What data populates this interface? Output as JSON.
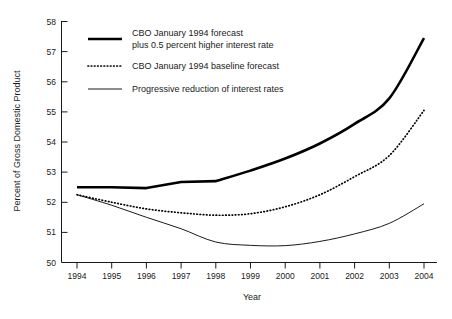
{
  "chart_data": {
    "type": "line",
    "title": "",
    "xlabel": "Year",
    "ylabel": "Percent of Gross Domestic Product",
    "xlim": [
      1994,
      2004
    ],
    "ylim": [
      50,
      58
    ],
    "ytick_labels": [
      "58",
      "57",
      "56",
      "55",
      "54",
      "53",
      "52",
      "51",
      "50"
    ],
    "yticks": [
      58,
      57,
      56,
      55,
      54,
      53,
      52,
      51,
      50
    ],
    "xtick_labels": [
      "1994",
      "1995",
      "1996",
      "1997",
      "1998",
      "1999",
      "2000",
      "2001",
      "2002",
      "2003",
      "2004"
    ],
    "x": [
      1994,
      1995,
      1996,
      1997,
      1998,
      1999,
      2000,
      2001,
      2002,
      2003,
      2004
    ],
    "grid": false,
    "legend_position": "upper-left-inside",
    "series": [
      {
        "name": "CBO January 1994 forecast plus 0.5 percent higher interest rate",
        "style": "bold-solid",
        "color": "#000000",
        "values": [
          52.5,
          52.5,
          52.47,
          52.67,
          52.7,
          53.05,
          53.45,
          53.95,
          54.6,
          55.45,
          56.4
        ]
      },
      {
        "name": "CBO January 1994 baseline forecast",
        "style": "dotted",
        "color": "#000000",
        "values": [
          52.25,
          52.0,
          51.78,
          51.65,
          51.57,
          51.62,
          51.85,
          52.25,
          52.85,
          53.55,
          54.35
        ]
      },
      {
        "name": "Progressive reduction of interest rates",
        "style": "thin-solid",
        "color": "#1a1a1a",
        "values": [
          52.25,
          51.9,
          51.5,
          51.12,
          50.68,
          50.57,
          50.56,
          50.7,
          50.95,
          51.3,
          51.7
        ]
      }
    ],
    "series_endpoint_2004": {
      "bold": 57.45,
      "dotted": 55.05,
      "thin": 51.95
    },
    "annotations": []
  },
  "legend": {
    "items": [
      {
        "line1": "CBO January 1994 forecast",
        "line2": "plus 0.5 percent higher interest rate",
        "swatch": "bold-solid-swatch"
      },
      {
        "line1": "CBO January 1994 baseline forecast",
        "line2": "",
        "swatch": "dotted-swatch"
      },
      {
        "line1": "Progressive reduction of interest rates",
        "line2": "",
        "swatch": "thin-solid-swatch"
      }
    ]
  },
  "axes": {
    "y_title": "Percent of Gross Domestic Product",
    "x_title": "Year"
  }
}
